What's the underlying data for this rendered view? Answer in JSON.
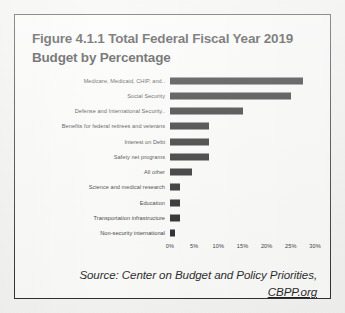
{
  "figure": {
    "title": "Figure 4.1.1 Total Federal Fiscal Year 2019 Budget by Percentage",
    "source_text": "Source: Center on Budget and Policy Priorities,",
    "source_link": "CBPP.org",
    "border_color": "#2b2b2b",
    "bar_color": "#171717",
    "page_background": "#f4f4f2"
  },
  "chart_data": {
    "type": "bar",
    "orientation": "horizontal",
    "title": "Figure 4.1.1 Total Federal Fiscal Year 2019 Budget by Percentage",
    "xlabel": "",
    "ylabel": "",
    "xlim": [
      0,
      30
    ],
    "grid": false,
    "legend": "none",
    "xticks": [
      "0%",
      "5%",
      "10%",
      "15%",
      "20%",
      "25%",
      "30%"
    ],
    "xtick_values": [
      0,
      5,
      10,
      15,
      20,
      25,
      30
    ],
    "categories": [
      "Medicare, Medicaid, CHIP, and..",
      "Social Security",
      "Defense and International Security..",
      "Benefits for federal retirees and veterans",
      "Interest on Debt",
      "Safety net programs",
      "All other",
      "Science and medical research",
      "Education",
      "Transportation infrastructure",
      "Non-security international"
    ],
    "values": [
      27.5,
      25,
      15,
      8,
      8,
      8,
      4.5,
      2,
      2,
      2,
      1
    ]
  }
}
